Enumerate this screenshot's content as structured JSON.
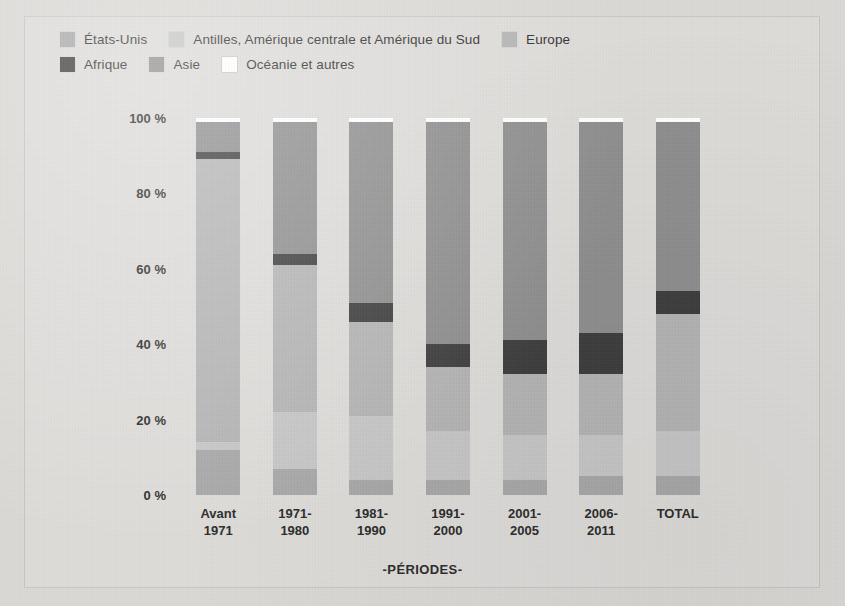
{
  "chart_data": {
    "type": "bar",
    "subtype": "stacked-percentage-column",
    "title": "",
    "xlabel": "-PÉRIODES-",
    "ylabel": "",
    "ylim": [
      0,
      100
    ],
    "yticks": [
      "0 %",
      "20 %",
      "40 %",
      "60 %",
      "80 %",
      "100 %"
    ],
    "ytick_values": [
      0,
      20,
      40,
      60,
      80,
      100
    ],
    "grid": false,
    "legend_position": "top-left",
    "categories": [
      "Avant 1971",
      "1971-1980",
      "1981-1990",
      "1991-2000",
      "2001-2005",
      "2006-2011",
      "TOTAL"
    ],
    "series": [
      {
        "name": "États-Unis",
        "color": "#a8a8a8",
        "values": [
          12,
          7,
          4,
          4,
          4,
          5,
          5
        ]
      },
      {
        "name": "Antilles, Amérique centrale et Amérique du Sud",
        "color": "#c6c6c6",
        "values": [
          2,
          15,
          17,
          13,
          12,
          11,
          12
        ]
      },
      {
        "name": "Europe",
        "color": "#b4b4b4",
        "values": [
          75,
          39,
          25,
          17,
          16,
          16,
          31
        ]
      },
      {
        "name": "Afrique",
        "color": "#3d3d3d",
        "values": [
          2,
          3,
          5,
          6,
          9,
          11,
          6
        ]
      },
      {
        "name": "Asie",
        "color": "#8e8e8e",
        "values": [
          8,
          35,
          48,
          59,
          58,
          56,
          45
        ]
      },
      {
        "name": "Océanie et autres",
        "color": "#ffffff",
        "values": [
          1,
          1,
          1,
          1,
          1,
          1,
          1
        ]
      }
    ]
  },
  "legend": {
    "rows": [
      [
        {
          "label": "États-Unis",
          "color": "#a8a8a8",
          "icon": "legend-swatch"
        },
        {
          "label": "Antilles, Amérique centrale et Amérique du Sud",
          "color": "#c6c6c6",
          "icon": "legend-swatch"
        },
        {
          "label": "Europe",
          "color": "#b4b4b4",
          "icon": "legend-swatch"
        }
      ],
      [
        {
          "label": "Afrique",
          "color": "#3d3d3d",
          "icon": "legend-swatch"
        },
        {
          "label": "Asie",
          "color": "#8e8e8e",
          "icon": "legend-swatch"
        },
        {
          "label": "Océanie et autres",
          "color": "#ffffff",
          "icon": "legend-swatch"
        }
      ]
    ]
  },
  "axis": {
    "x_title": "-PÉRIODES-",
    "x_categories": [
      {
        "line1": "Avant",
        "line2": "1971"
      },
      {
        "line1": "1971-",
        "line2": "1980"
      },
      {
        "line1": "1981-",
        "line2": "1990"
      },
      {
        "line1": "1991-",
        "line2": "2000"
      },
      {
        "line1": "2001-",
        "line2": "2005"
      },
      {
        "line1": "2006-",
        "line2": "2011"
      },
      {
        "line1": "TOTAL",
        "line2": ""
      }
    ],
    "y_ticks": [
      "100 %",
      "80 %",
      "60 %",
      "40 %",
      "20 %",
      "0 %"
    ]
  },
  "colors": {
    "background": "#dbd9d5",
    "frame_border": "#c9c6c1",
    "text": "#2b2b2b"
  }
}
